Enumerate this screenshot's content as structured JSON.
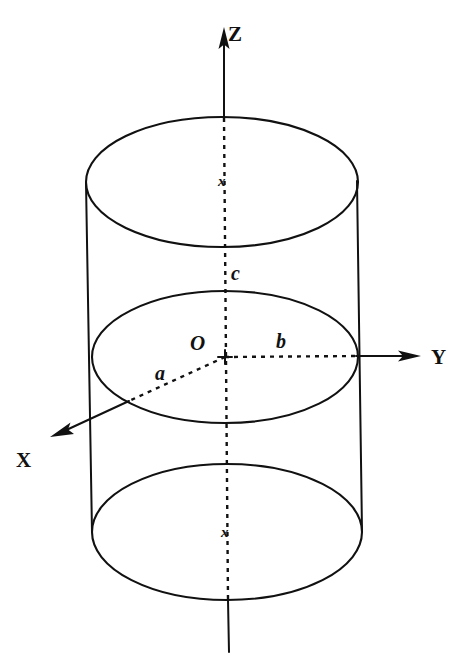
{
  "figure": {
    "background_color": "#ffffff",
    "ink_color": "#111111",
    "axes": [
      {
        "id": "z",
        "label": "Z",
        "label_x": 235,
        "label_y": 40,
        "direction": "up"
      },
      {
        "id": "y",
        "label": "Y",
        "label_x": 433,
        "label_y": 364,
        "direction": "right"
      },
      {
        "id": "x",
        "label": "X",
        "label_x": 18,
        "label_y": 467,
        "direction": "down-left"
      }
    ],
    "dimensions": [
      {
        "id": "a",
        "label": "a",
        "label_x": 155,
        "label_y": 380,
        "meaning": "semi-axis along X"
      },
      {
        "id": "b",
        "label": "b",
        "label_x": 276,
        "label_y": 348,
        "meaning": "semi-axis along Y"
      },
      {
        "id": "c",
        "label": "c",
        "label_x": 231,
        "label_y": 280,
        "meaning": "half-height along Z"
      }
    ],
    "origin": {
      "label": "O",
      "label_x": 190,
      "label_y": 350,
      "x": 225,
      "y": 357
    },
    "center_marks": [
      {
        "id": "top-center-mark",
        "label": "x",
        "x": 218,
        "y": 186
      },
      {
        "id": "bottom-center-mark",
        "label": "x",
        "x": 221,
        "y": 537
      }
    ],
    "geometry": {
      "top_ellipse": {
        "cx": 222,
        "cy": 182,
        "rx": 136,
        "ry": 65
      },
      "mid_ellipse": {
        "cx": 225,
        "cy": 357,
        "rx": 133,
        "ry": 66
      },
      "bottom_ellipse": {
        "cx": 227,
        "cy": 532,
        "rx": 135,
        "ry": 68
      },
      "left_edge": {
        "x1": 86,
        "y1": 183,
        "x2": 92,
        "y2": 532
      },
      "right_edge": {
        "x1": 357,
        "y1": 181,
        "x2": 362,
        "y2": 531
      },
      "z_axis_solid_top": {
        "x1": 224,
        "y1": 28,
        "x2": 224,
        "y2": 118
      },
      "z_axis_dashed": {
        "x1": 224,
        "y1": 118,
        "x2": 228,
        "y2": 600
      },
      "z_axis_solid_bottom": {
        "x1": 228,
        "y1": 600,
        "x2": 229,
        "y2": 652
      },
      "y_axis_dashed": {
        "x1": 225,
        "y1": 357,
        "x2": 358,
        "y2": 356
      },
      "y_axis_solid": {
        "x1": 358,
        "y1": 356,
        "x2": 410,
        "y2": 356
      },
      "a_dashed": {
        "x1": 225,
        "y1": 357,
        "x2": 128,
        "y2": 401
      },
      "x_axis_solid": {
        "x1": 128,
        "y1": 401,
        "x2": 58,
        "y2": 433
      }
    }
  }
}
